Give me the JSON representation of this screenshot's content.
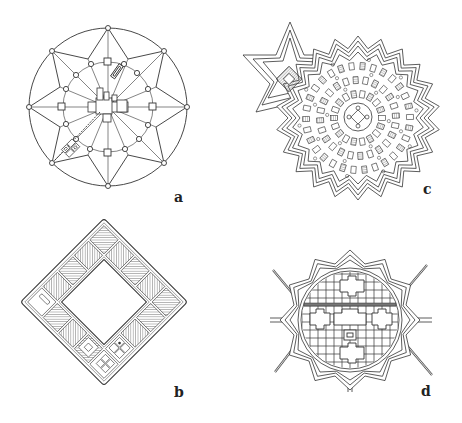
{
  "figure": {
    "panels": [
      {
        "id": "a",
        "label": "a",
        "description": "Radial ideal city plan: circular wall with 8 gate nodes, star-shaped street pattern, inner ring road with squares, central piazza"
      },
      {
        "id": "b",
        "label": "b",
        "description": "Square city plan rotated 45 degrees, ring of hatched blocks around open central square"
      },
      {
        "id": "c",
        "label": "c",
        "description": "Star-shaped fortified city with many-pointed bastion outline, dense radial blocks, attached six-pointed citadel"
      },
      {
        "id": "d",
        "label": "d",
        "description": "Polygonal bastioned fortress enclosing a circular grid plan with cross-shaped squares"
      }
    ],
    "colors": {
      "background": "#ffffff",
      "line": "#333333",
      "hatch": "#555555",
      "label": "#222222"
    }
  }
}
